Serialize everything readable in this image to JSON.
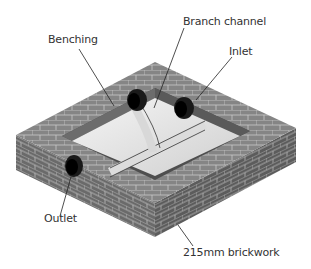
{
  "labels": {
    "benching": "Benching",
    "branch_channel": "Branch channel",
    "inlet": "Inlet",
    "outlet": "Outlet",
    "brickwork": "215mm brickwork"
  },
  "colors": {
    "brick": "#6e6e6e",
    "brick_dark": "#555555",
    "brick_top": "#8a8a8a",
    "mortar": "#c8c8c8",
    "benching": "#e6e6e6",
    "pipe": "#1a1a1a",
    "text": "#333333"
  }
}
